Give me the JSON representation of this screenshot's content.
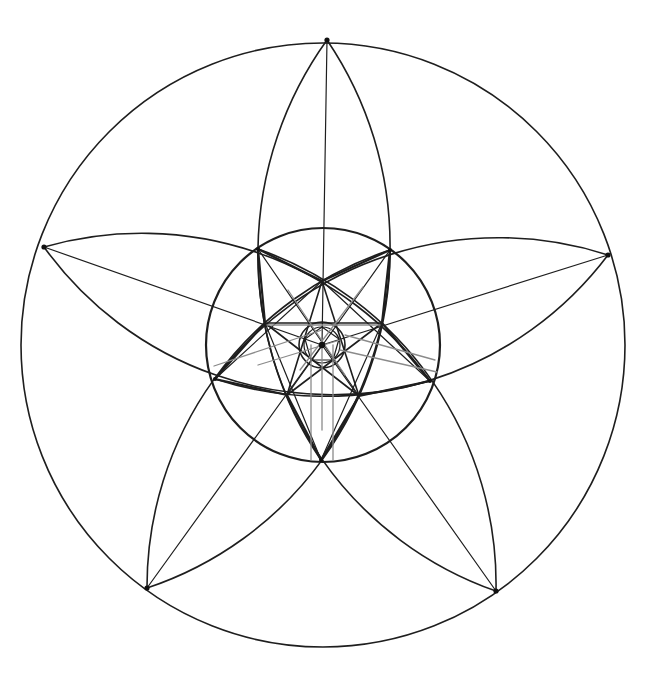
{
  "figure": {
    "title": "",
    "stroke_color": "#1e1e1e",
    "faint_color": "#8a8a8a",
    "background": "#ffffff"
  },
  "geometry": {
    "center": [
      322,
      345
    ],
    "outer_circle": {
      "cx": 323,
      "cy": 345,
      "r": 302
    },
    "middle_circle": {
      "cx": 323,
      "cy": 345,
      "r": 117
    },
    "small_circles": [
      {
        "cx": 322,
        "cy": 345,
        "r": 23
      },
      {
        "cx": 322,
        "cy": 345,
        "r": 18
      }
    ],
    "outer_points": [
      [
        327,
        40
      ],
      [
        608,
        255
      ],
      [
        496,
        591
      ],
      [
        147,
        588
      ],
      [
        44,
        247
      ]
    ],
    "middle_vertices": [
      [
        390,
        250
      ],
      [
        430,
        381
      ],
      [
        321,
        460
      ],
      [
        215,
        379
      ],
      [
        258,
        249
      ]
    ],
    "inner_vertices": [
      [
        322,
        281
      ],
      [
        382,
        323
      ],
      [
        359,
        396
      ],
      [
        287,
        395
      ],
      [
        265,
        323
      ]
    ],
    "petals": [
      {
        "from": [
          327,
          40
        ],
        "to": [
          321,
          460
        ],
        "r": 367
      },
      {
        "from": [
          608,
          255
        ],
        "to": [
          215,
          379
        ],
        "r": 355
      },
      {
        "from": [
          496,
          591
        ],
        "to": [
          258,
          249
        ],
        "r": 355
      },
      {
        "from": [
          147,
          588
        ],
        "to": [
          390,
          250
        ],
        "r": 355
      },
      {
        "from": [
          44,
          247
        ],
        "to": [
          430,
          381
        ],
        "r": 355
      }
    ]
  }
}
